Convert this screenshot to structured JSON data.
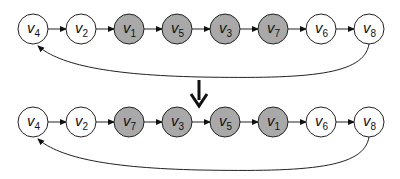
{
  "diagram": {
    "type": "node reordering (before / after)",
    "colors": {
      "highlighted_fill": "#a9a9a9",
      "plain_fill": "#ffffff",
      "stroke": "#222222"
    },
    "rows": [
      {
        "name": "before",
        "nodes": [
          {
            "label": "v",
            "sub": "4",
            "highlighted": false
          },
          {
            "label": "v",
            "sub": "2",
            "highlighted": false
          },
          {
            "label": "v",
            "sub": "1",
            "highlighted": true
          },
          {
            "label": "v",
            "sub": "5",
            "highlighted": true
          },
          {
            "label": "v",
            "sub": "3",
            "highlighted": true
          },
          {
            "label": "v",
            "sub": "7",
            "highlighted": true
          },
          {
            "label": "v",
            "sub": "6",
            "highlighted": false
          },
          {
            "label": "v",
            "sub": "8",
            "highlighted": false
          }
        ],
        "back_edge": {
          "from": "v8",
          "to": "v4"
        }
      },
      {
        "name": "after",
        "nodes": [
          {
            "label": "v",
            "sub": "4",
            "highlighted": false
          },
          {
            "label": "v",
            "sub": "2",
            "highlighted": false
          },
          {
            "label": "v",
            "sub": "7",
            "highlighted": true
          },
          {
            "label": "v",
            "sub": "3",
            "highlighted": true
          },
          {
            "label": "v",
            "sub": "5",
            "highlighted": true
          },
          {
            "label": "v",
            "sub": "1",
            "highlighted": true
          },
          {
            "label": "v",
            "sub": "6",
            "highlighted": false
          },
          {
            "label": "v",
            "sub": "8",
            "highlighted": false
          }
        ],
        "back_edge": {
          "from": "v8",
          "to": "v4"
        }
      }
    ],
    "transition_arrow": "down-arrow"
  }
}
